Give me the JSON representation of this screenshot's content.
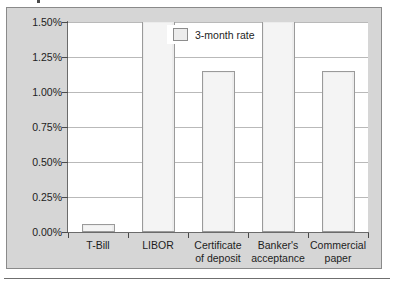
{
  "chart_data": {
    "type": "bar",
    "title": "",
    "subtitle": "",
    "xlabel": "",
    "ylabel": "",
    "categories": [
      "T-Bill",
      "LIBOR",
      "Certificate\nof deposit",
      "Banker's\nacceptance",
      "Commercial\npaper"
    ],
    "series": [
      {
        "name": "3-month rate",
        "values": [
          0.06,
          1.5,
          1.15,
          1.5,
          1.15
        ]
      }
    ],
    "value_suffix": "%",
    "ylim": [
      0.0,
      1.5
    ],
    "ytick_labels": [
      "0.00%",
      "0.25%",
      "0.50%",
      "0.75%",
      "1.00%",
      "1.25%",
      "1.50%"
    ],
    "ytick_values": [
      0.0,
      0.25,
      0.5,
      0.75,
      1.0,
      1.25,
      1.5
    ],
    "grid": true,
    "legend": {
      "position": "top-center-inside",
      "entries": [
        "3-month rate"
      ]
    },
    "colors": {
      "bar_fill": "#ececec",
      "bar_stroke": "#9a9a9a",
      "plot_background": "#ffffff",
      "figure_background": "#d6d6d6",
      "frame_border": "#8a8a8a",
      "gridline": "#b9b9b9",
      "axis": "#6b6b6b",
      "text": "#1d1d1d"
    }
  }
}
